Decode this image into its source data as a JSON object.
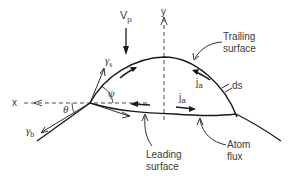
{
  "diagram": {
    "type": "schematic",
    "labels": {
      "vp_main": "V",
      "vp_sub": "p",
      "y_axis": "y",
      "x_axis": "x",
      "gamma_s_main": "γ",
      "gamma_s_sub": "s",
      "gamma_b_main": "γ",
      "gamma_b_sub": "b",
      "theta": "θ",
      "psi": "ψ",
      "ja_upper_main": "j",
      "ja_upper_sub": "a",
      "ja_lower_main": "j",
      "ja_lower_sub": "a",
      "ds": "ds",
      "trailing_line1": "Trailing",
      "trailing_line2": "surface",
      "leading_line1": "Leading",
      "leading_line2": "surface",
      "atom_line1": "Atom",
      "atom_line2": "flux"
    },
    "colors": {
      "line": "#1a1a1a",
      "text": "#3a3a3a",
      "background": "#ffffff"
    }
  }
}
